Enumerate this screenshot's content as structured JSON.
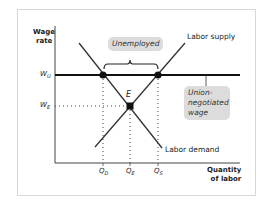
{
  "axes": {
    "y_label_line1": "Wage",
    "y_label_line2": "rate",
    "x_label_line1": "Quantity",
    "x_label_line2": "of labor"
  },
  "y_ticks": {
    "wu": "W",
    "wu_sub": "U",
    "we": "W",
    "we_sub": "E"
  },
  "x_ticks": {
    "qd": "Q",
    "qd_sub": "D",
    "qe": "Q",
    "qe_sub": "E",
    "qs": "Q",
    "qs_sub": "S"
  },
  "curves": {
    "supply": "Labor supply",
    "demand": "Labor demand"
  },
  "equilibrium_label": "E",
  "callouts": {
    "unemployed": "Unemployed",
    "union_line1": "Union-",
    "union_line2": "negotiated",
    "union_line3": "wage"
  },
  "colors": {
    "line": "#222222",
    "callout_bg": "#dcdcdc",
    "frame": "#d8d8d8"
  }
}
